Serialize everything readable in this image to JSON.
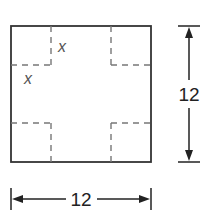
{
  "diagram": {
    "square": {
      "side_label": "12"
    },
    "corner_cut": {
      "label_top": "x",
      "label_left": "x"
    },
    "dimensions": {
      "width_label": "12",
      "height_label": "12"
    },
    "colors": {
      "outline": "#333333",
      "dashed": "#666666",
      "label": "#555555",
      "dimension_text": "#222222"
    }
  }
}
